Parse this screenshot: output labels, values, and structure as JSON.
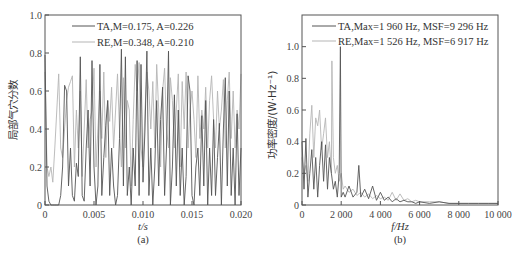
{
  "chart_data": [
    {
      "id": "a",
      "type": "line",
      "caption": "(a)",
      "xlabel": "t/s",
      "ylabel": "局部气穴分数",
      "xlim": [
        0,
        0.02
      ],
      "ylim": [
        0,
        1.0
      ],
      "xticks": [
        0,
        0.005,
        0.01,
        0.015,
        0.02
      ],
      "xtick_labels": [
        "0",
        "0.005",
        "0.010",
        "0.015",
        "0.020"
      ],
      "yticks": [
        0,
        0.2,
        0.4,
        0.6,
        0.8,
        1.0
      ],
      "ytick_labels": [
        "0",
        "0.2",
        "0.4",
        "0.6",
        "0.8",
        "1.0"
      ],
      "legend_position": "upper center",
      "series": [
        {
          "name": "TA",
          "legend": "TA,M=0.175, A=0.226",
          "color": "#555555",
          "M": 0.175,
          "A": 0.226,
          "x": [
            0,
            0.0002,
            0.0004,
            0.0006,
            0.0008,
            0.001,
            0.0012,
            0.0014,
            0.0016,
            0.0018,
            0.002,
            0.0022,
            0.0024,
            0.0026,
            0.0028,
            0.003,
            0.0032,
            0.0034,
            0.0036,
            0.0038,
            0.004,
            0.0042,
            0.0044,
            0.0046,
            0.0048,
            0.005,
            0.0052,
            0.0054,
            0.0056,
            0.0058,
            0.006,
            0.0062,
            0.0064,
            0.0066,
            0.0068,
            0.007,
            0.0072,
            0.0074,
            0.0076,
            0.0078,
            0.008,
            0.0082,
            0.0084,
            0.0086,
            0.0088,
            0.009,
            0.0092,
            0.0094,
            0.0096,
            0.0098,
            0.01,
            0.0102,
            0.0104,
            0.0106,
            0.0108,
            0.011,
            0.0112,
            0.0114,
            0.0116,
            0.0118,
            0.012,
            0.0122,
            0.0124,
            0.0126,
            0.0128,
            0.013,
            0.0132,
            0.0134,
            0.0136,
            0.0138,
            0.014,
            0.0142,
            0.0144,
            0.0146,
            0.0148,
            0.015,
            0.0152,
            0.0154,
            0.0156,
            0.0158,
            0.016,
            0.0162,
            0.0164,
            0.0166,
            0.0168,
            0.017,
            0.0172,
            0.0174,
            0.0176,
            0.0178,
            0.018,
            0.0182,
            0.0184,
            0.0186,
            0.0188,
            0.019,
            0.0192,
            0.0194,
            0.0196,
            0.0198,
            0.02
          ],
          "values": [
            0.79,
            0.1,
            0.02,
            0.0,
            0.0,
            0.0,
            0.0,
            0.0,
            0.05,
            0.2,
            0.63,
            0.6,
            0.1,
            0.3,
            0.05,
            0.02,
            0.22,
            0.15,
            0.78,
            0.05,
            0.02,
            0.3,
            0.5,
            0.1,
            0.76,
            0.2,
            0.0,
            0.1,
            0.74,
            0.05,
            0.25,
            0.42,
            0.55,
            0.05,
            0.3,
            0.1,
            0.0,
            0.05,
            0.35,
            0.82,
            0.1,
            0.78,
            0.05,
            0.2,
            0.0,
            0.3,
            0.1,
            0.76,
            0.05,
            0.74,
            0.12,
            0.4,
            0.81,
            0.05,
            0.3,
            0.0,
            0.2,
            0.55,
            0.1,
            0.45,
            0.62,
            0.05,
            0.3,
            0.81,
            0.0,
            0.2,
            0.58,
            0.1,
            0.5,
            0.05,
            0.3,
            0.0,
            0.15,
            0.68,
            0.6,
            0.05,
            0.0,
            0.2,
            0.3,
            0.05,
            0.47,
            0.1,
            0.55,
            0.0,
            0.3,
            0.05,
            0.45,
            0.05,
            0.25,
            0.43,
            0.0,
            0.4,
            0.67,
            0.1,
            0.6,
            0.05,
            0.3,
            0.0,
            0.48,
            0.05,
            0.3
          ],
          "note": "values approximate, estimated from dense trace"
        },
        {
          "name": "RE",
          "legend": "RE,M=0.348, A=0.210",
          "color": "#b5b5b5",
          "M": 0.348,
          "A": 0.21,
          "x": [
            0,
            0.0002,
            0.0004,
            0.0006,
            0.0008,
            0.001,
            0.0012,
            0.0014,
            0.0016,
            0.0018,
            0.002,
            0.0022,
            0.0024,
            0.0026,
            0.0028,
            0.003,
            0.0032,
            0.0034,
            0.0036,
            0.0038,
            0.004,
            0.0042,
            0.0044,
            0.0046,
            0.0048,
            0.005,
            0.0052,
            0.0054,
            0.0056,
            0.0058,
            0.006,
            0.0062,
            0.0064,
            0.0066,
            0.0068,
            0.007,
            0.0072,
            0.0074,
            0.0076,
            0.0078,
            0.008,
            0.0082,
            0.0084,
            0.0086,
            0.0088,
            0.009,
            0.0092,
            0.0094,
            0.0096,
            0.0098,
            0.01,
            0.0102,
            0.0104,
            0.0106,
            0.0108,
            0.011,
            0.0112,
            0.0114,
            0.0116,
            0.0118,
            0.012,
            0.0122,
            0.0124,
            0.0126,
            0.0128,
            0.013,
            0.0132,
            0.0134,
            0.0136,
            0.0138,
            0.014,
            0.0142,
            0.0144,
            0.0146,
            0.0148,
            0.015,
            0.0152,
            0.0154,
            0.0156,
            0.0158,
            0.016,
            0.0162,
            0.0164,
            0.0166,
            0.0168,
            0.017,
            0.0172,
            0.0174,
            0.0176,
            0.0178,
            0.018,
            0.0182,
            0.0184,
            0.0186,
            0.0188,
            0.019,
            0.0192,
            0.0194,
            0.0196,
            0.0198,
            0.02
          ],
          "values": [
            0.7,
            0.2,
            0.15,
            0.2,
            0.12,
            0.3,
            0.5,
            0.69,
            0.3,
            0.25,
            0.4,
            0.55,
            0.62,
            0.65,
            0.68,
            0.2,
            0.5,
            0.3,
            0.6,
            0.15,
            0.4,
            0.66,
            0.3,
            0.45,
            0.5,
            0.72,
            0.2,
            0.4,
            0.6,
            0.35,
            0.7,
            0.25,
            0.55,
            0.44,
            0.62,
            0.3,
            0.5,
            0.69,
            0.4,
            0.2,
            0.67,
            0.3,
            0.55,
            0.5,
            0.1,
            0.45,
            0.74,
            0.6,
            0.75,
            0.3,
            0.2,
            0.5,
            0.7,
            0.6,
            0.4,
            0.65,
            0.3,
            0.74,
            0.5,
            0.2,
            0.6,
            0.72,
            0.4,
            0.3,
            0.67,
            0.55,
            0.3,
            0.5,
            0.69,
            0.2,
            0.65,
            0.4,
            0.7,
            0.3,
            0.5,
            0.6,
            0.45,
            0.25,
            0.68,
            0.35,
            0.5,
            0.4,
            0.62,
            0.3,
            0.55,
            0.68,
            0.45,
            0.3,
            0.6,
            0.4,
            0.5,
            0.66,
            0.3,
            0.55,
            0.7,
            0.35,
            0.6,
            0.3,
            0.5,
            0.4,
            0.69
          ],
          "note": "values approximate, estimated from dense trace"
        }
      ]
    },
    {
      "id": "b",
      "type": "line",
      "caption": "(b)",
      "xlabel": "f/Hz",
      "ylabel": "功率密度/(W·Hz⁻¹)",
      "xlim": [
        0,
        10000
      ],
      "ylim": [
        0,
        1.2
      ],
      "xticks": [
        0,
        2000,
        4000,
        6000,
        8000,
        10000
      ],
      "xtick_labels": [
        "0",
        "2 000",
        "4 000",
        "6 000",
        "8 000",
        "10 000"
      ],
      "yticks": [
        0,
        0.2,
        0.4,
        0.6,
        0.8,
        1.0
      ],
      "ytick_labels": [
        "0",
        "0.2",
        "0.4",
        "0.6",
        "0.8",
        "1.0"
      ],
      "legend_position": "upper right",
      "series": [
        {
          "name": "TA",
          "legend": "TA,Max=1 960 Hz, MSF=9 296 Hz",
          "color": "#555555",
          "Max_Hz": 1960,
          "MSF_Hz": 9296,
          "x": [
            0,
            100,
            200,
            300,
            400,
            500,
            600,
            700,
            800,
            900,
            1000,
            1100,
            1200,
            1300,
            1400,
            1500,
            1600,
            1700,
            1800,
            1900,
            1960,
            2000,
            2100,
            2200,
            2400,
            2600,
            2800,
            2900,
            3000,
            3200,
            3400,
            3600,
            3800,
            4000,
            4200,
            4400,
            4600,
            4800,
            5000,
            5200,
            5400,
            5600,
            5800,
            6000,
            6500,
            7000,
            7500,
            8000,
            8500,
            9000,
            9500,
            10000
          ],
          "values": [
            0.4,
            0.1,
            0.42,
            0.05,
            0.2,
            0.35,
            0.1,
            0.3,
            0.05,
            0.25,
            0.4,
            0.15,
            0.38,
            0.1,
            0.3,
            0.2,
            0.1,
            0.15,
            0.05,
            0.2,
            1.0,
            0.05,
            0.08,
            0.05,
            0.12,
            0.05,
            0.08,
            0.25,
            0.05,
            0.1,
            0.04,
            0.12,
            0.03,
            0.08,
            0.03,
            0.05,
            0.02,
            0.04,
            0.02,
            0.03,
            0.02,
            0.02,
            0.01,
            0.02,
            0.01,
            0.02,
            0.01,
            0.01,
            0.01,
            0.01,
            0.01,
            0.01
          ],
          "note": "values approximate"
        },
        {
          "name": "RE",
          "legend": "RE,Max=1 526 Hz, MSF=6 917 Hz",
          "color": "#b5b5b5",
          "Max_Hz": 1526,
          "MSF_Hz": 6917,
          "x": [
            0,
            100,
            200,
            300,
            400,
            500,
            600,
            700,
            800,
            900,
            1000,
            1100,
            1200,
            1300,
            1400,
            1500,
            1526,
            1600,
            1700,
            1800,
            1900,
            2000,
            2100,
            2200,
            2400,
            2600,
            2800,
            3000,
            3200,
            3400,
            3600,
            3800,
            4000,
            4200,
            4400,
            4600,
            4800,
            5000,
            5200,
            5400,
            5600,
            5800,
            6000,
            6500,
            7000,
            7500,
            8000,
            8500,
            9000,
            9500,
            10000
          ],
          "values": [
            0.3,
            0.2,
            0.25,
            0.15,
            0.45,
            0.63,
            0.3,
            0.55,
            0.5,
            0.6,
            0.35,
            0.45,
            0.55,
            0.3,
            0.4,
            0.2,
            0.91,
            0.3,
            0.2,
            0.25,
            0.15,
            0.2,
            0.1,
            0.12,
            0.08,
            0.1,
            0.06,
            0.08,
            0.05,
            0.07,
            0.04,
            0.06,
            0.04,
            0.05,
            0.03,
            0.08,
            0.03,
            0.07,
            0.03,
            0.04,
            0.02,
            0.03,
            0.02,
            0.02,
            0.02,
            0.01,
            0.01,
            0.01,
            0.01,
            0.01,
            0.01
          ],
          "note": "values approximate"
        }
      ]
    }
  ]
}
